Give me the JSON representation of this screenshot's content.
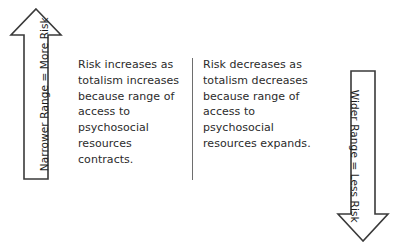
{
  "diagram": {
    "left_arrow": {
      "icon": "arrow-up-icon",
      "direction": "up",
      "label": "Narrower  Range = More Risk",
      "stroke_color": "#3a3a3a",
      "fill_color": "#ffffff"
    },
    "right_arrow": {
      "icon": "arrow-down-icon",
      "direction": "down",
      "label": "Wider Range = Less Risk",
      "stroke_color": "#3a3a3a",
      "fill_color": "#ffffff"
    },
    "left_text": "Risk increases as totalism increases because range of access to psychosocial resources contracts.",
    "right_text": "Risk decreases as totalism decreases because range of access to psychosocial resources expands.",
    "divider_color": "#6e6e6e",
    "text_color": "#2b2b2b",
    "background_color": "#ffffff"
  }
}
